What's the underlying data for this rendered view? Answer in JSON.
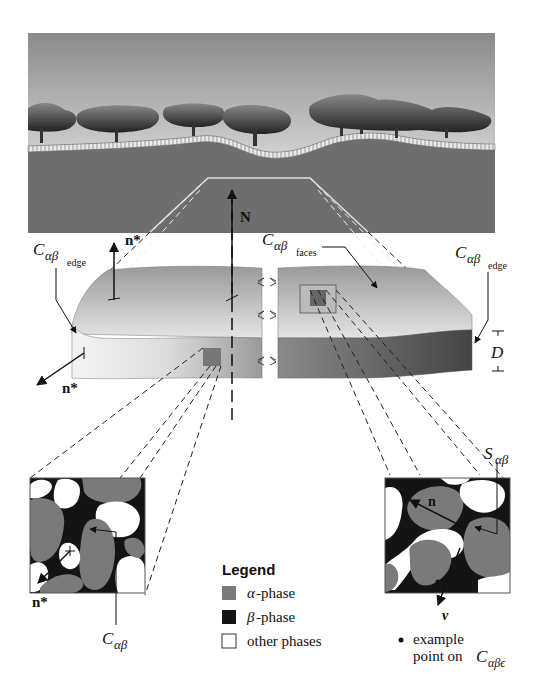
{
  "landscape": {
    "sky_top": "#8c8c8c",
    "sky_bottom": "#f2f2f2",
    "ground": "#6e6e6e",
    "trees": "#3a3a3a"
  },
  "labels": {
    "N": "N",
    "n_star_top": "n*",
    "n_star_left": "n*",
    "n_star_inset": "n*",
    "c_edge_left_main": "C",
    "c_edge_left_sub": "αβ",
    "c_edge_left_subsub": "edge",
    "c_faces_main": "C",
    "c_faces_sub": "αβ",
    "c_faces_subsub": "faces",
    "c_edge_right_main": "C",
    "c_edge_right_sub": "αβ",
    "c_edge_right_subsub": "edge",
    "D": "D",
    "s_ab_main": "S",
    "s_ab_sub": "αβ",
    "n_inset": "n",
    "nu": "ν",
    "c_ab_main": "C",
    "c_ab_sub": "αβ",
    "example_line1": "example",
    "example_line2": "point on ",
    "example_c_main": "C",
    "example_c_sub": "αβϵ"
  },
  "legend": {
    "title": "Legend",
    "items": [
      {
        "symbol": "α",
        "label": "-phase",
        "color": "#7a7a7a"
      },
      {
        "symbol": "β",
        "label": "-phase",
        "color": "#141414"
      },
      {
        "symbol": "",
        "label": "other phases",
        "color": "#ffffff"
      }
    ]
  },
  "colors": {
    "alpha": "#7a7a7a",
    "beta": "#141414",
    "other": "#ffffff",
    "slab_top": "#c8c8c8",
    "slab_side_light": "#e0e0e0",
    "slab_side_dark": "#555555"
  }
}
